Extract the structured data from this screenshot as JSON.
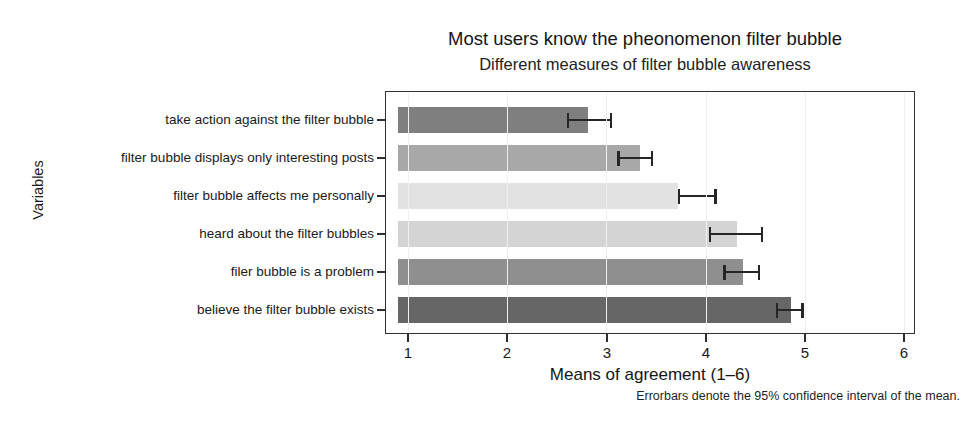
{
  "chart_data": {
    "type": "bar",
    "orientation": "horizontal",
    "title": "Most users know the pheonomenon filter bubble",
    "subtitle": "Different measures of filter bubble awareness",
    "xlabel": "Means of agreement (1–6)",
    "ylabel": "Variables",
    "caption": "Errorbars denote the 95% confidence interval of the mean.",
    "xlim": [
      1,
      6
    ],
    "xticks": [
      1,
      2,
      3,
      4,
      5,
      6
    ],
    "xticklabels": [
      "1",
      "2",
      "3",
      "4",
      "5",
      "6"
    ],
    "grid": false,
    "legend": "none",
    "categories": [
      "take action against the filter bubble",
      "filter bubble displays only interesting posts",
      "filter bubble affects me personally",
      "heard about the filter bubbles",
      "filer bubble is a problem",
      "believe the filter bubble exists"
    ],
    "values": [
      2.81,
      3.34,
      3.72,
      4.32,
      4.38,
      4.86
    ],
    "ci_low": [
      2.6,
      3.11,
      3.72,
      4.03,
      4.18,
      4.71
    ],
    "ci_high": [
      3.06,
      3.47,
      4.11,
      4.58,
      4.55,
      4.99
    ],
    "bar_colors": [
      "#7f7f7f",
      "#a8a8a8",
      "#e2e2e2",
      "#d4d4d4",
      "#8f8f8f",
      "#666666"
    ],
    "errorbar_color": "#262626",
    "panel_border_color": "#303030",
    "background_color": "#ffffff"
  }
}
